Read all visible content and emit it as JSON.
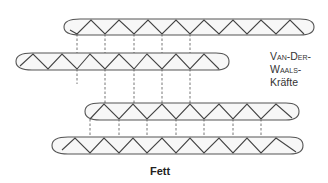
{
  "diagram": {
    "title": "Fett",
    "label": {
      "line1": "Van-Der-",
      "line2": "Waals-",
      "line3": "Kräfte"
    },
    "chains": [
      {
        "name": "chain-1",
        "x_start": 64,
        "x_end": 312,
        "y_top": 19,
        "y_bottom": 35
      },
      {
        "name": "chain-2",
        "x_start": 16,
        "x_end": 228,
        "y_top": 53,
        "y_bottom": 70
      },
      {
        "name": "chain-3",
        "x_start": 85,
        "x_end": 298,
        "y_top": 103,
        "y_bottom": 120
      },
      {
        "name": "chain-4",
        "x_start": 52,
        "x_end": 302,
        "y_top": 137,
        "y_bottom": 154
      }
    ],
    "colors": {
      "stroke": "#444444",
      "fill": "#f7f7f7",
      "text": "#333333"
    }
  }
}
